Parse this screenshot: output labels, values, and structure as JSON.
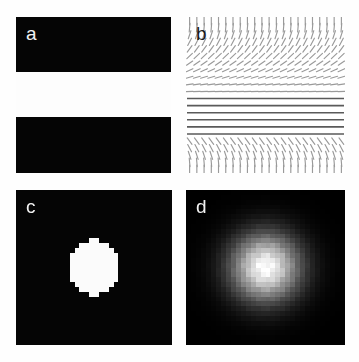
{
  "figure": {
    "background": "#ffffff",
    "width": 359,
    "height": 362,
    "layout": "2x2 panel grid"
  },
  "panels": [
    {
      "id": "a",
      "label": "a",
      "label_color": "#f2f2f2",
      "description": "binary mask: two black horizontal bars on white gap",
      "background": "#fdfdfd",
      "foreground": "#050505"
    },
    {
      "id": "b",
      "label": "b",
      "label_color": "#1a1a1a",
      "description": "orientation vector field of short line segments rotating from vertical to horizontal",
      "background": "#ffffff",
      "stroke_color": "#9a9a9a",
      "band_color": "#5a5a5a"
    },
    {
      "id": "c",
      "label": "c",
      "label_color": "#f2f2f2",
      "description": "pixelated binary white blob on black field",
      "background": "#050505",
      "foreground": "#fbfbfb"
    },
    {
      "id": "d",
      "label": "d",
      "label_color": "#f2f2f2",
      "description": "gaussian blurred blob, bright core fading to black",
      "background": "#040404",
      "foreground": "#ffffff"
    }
  ],
  "chart_data": {
    "type": "heatmap",
    "title": "",
    "xlabel": "",
    "ylabel": "",
    "panel_a": {
      "type": "binary-mask",
      "grid": [
        155,
        156
      ],
      "bars": [
        {
          "y0": 0,
          "y1": 55,
          "value": 1
        },
        {
          "y0": 55,
          "y1": 100,
          "value": 0
        },
        {
          "y0": 100,
          "y1": 156,
          "value": 1
        }
      ]
    },
    "panel_b": {
      "type": "vector-field",
      "cols": 22,
      "rows": 22,
      "angles_deg_by_row": [
        80,
        78,
        75,
        71,
        66,
        60,
        52,
        42,
        30,
        16,
        4,
        0,
        0,
        0,
        0,
        0,
        0,
        -4,
        -16,
        -30,
        -42,
        -52,
        -60,
        -66,
        -71,
        -75,
        -78,
        -80
      ],
      "horizontal_band_rows": [
        11,
        12,
        13,
        14,
        15,
        16
      ],
      "segment_length": 7
    },
    "panel_c": {
      "type": "binary-blob",
      "grid": [
        32,
        32
      ],
      "center": [
        16,
        16
      ],
      "radius": 6.3,
      "values": [
        0,
        1
      ]
    },
    "panel_d": {
      "type": "gaussian-blob",
      "grid": [
        32,
        32
      ],
      "center": [
        16,
        16
      ],
      "sigma": 4.6,
      "peak": 1.0,
      "min": 0.0
    }
  }
}
